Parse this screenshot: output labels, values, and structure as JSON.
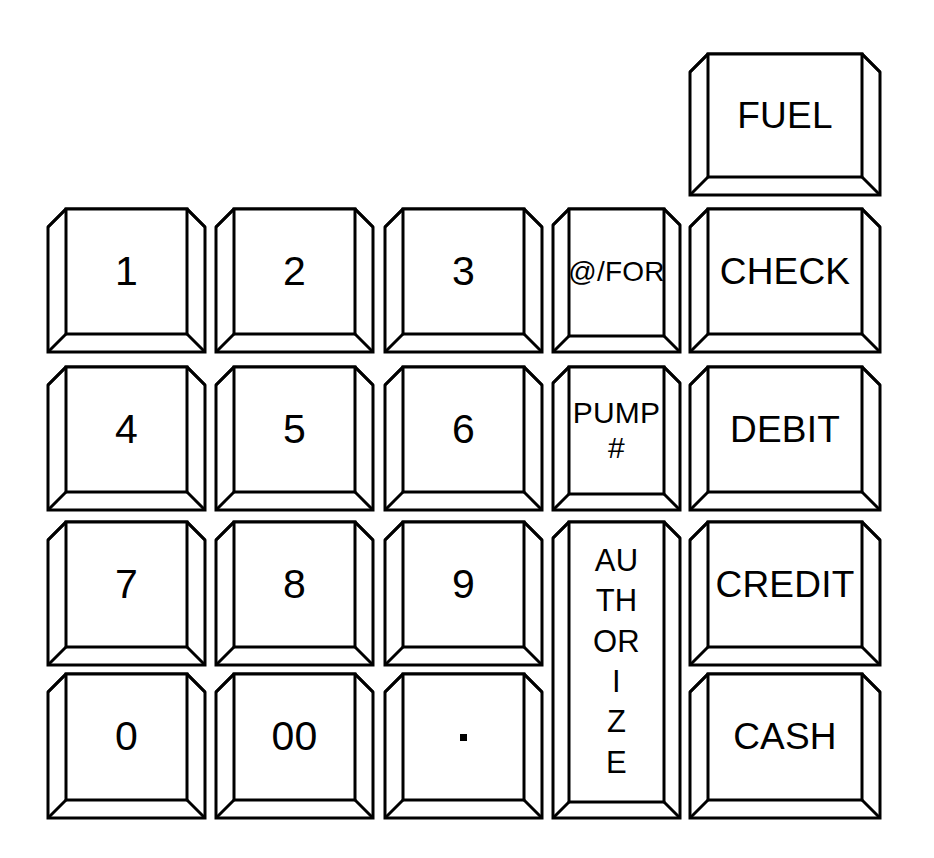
{
  "diagram": {
    "background_color": "#ffffff",
    "line_color": "#000000",
    "face_color": "#ffffff",
    "width": 934,
    "height": 858
  },
  "keys": [
    {
      "id": "fuel",
      "label": "FUEL",
      "label_style": "word",
      "x": 690,
      "y": 54,
      "w": 190,
      "h": 141,
      "bevel": 18,
      "column": 5,
      "row": 0
    },
    {
      "id": "one",
      "label": "1",
      "label_style": "digit",
      "x": 48,
      "y": 209,
      "w": 157,
      "h": 143,
      "bevel": 18,
      "column": 1,
      "row": 1
    },
    {
      "id": "two",
      "label": "2",
      "label_style": "digit",
      "x": 216,
      "y": 209,
      "w": 157,
      "h": 143,
      "bevel": 18,
      "column": 2,
      "row": 1
    },
    {
      "id": "three",
      "label": "3",
      "label_style": "digit",
      "x": 385,
      "y": 209,
      "w": 157,
      "h": 143,
      "bevel": 18,
      "column": 3,
      "row": 1
    },
    {
      "id": "at-for",
      "label": "@/FOR",
      "label_style": "small",
      "x": 553,
      "y": 209,
      "w": 127,
      "h": 143,
      "bevel": 16,
      "column": 4,
      "row": 1
    },
    {
      "id": "check",
      "label": "CHECK",
      "label_style": "word",
      "x": 690,
      "y": 209,
      "w": 190,
      "h": 143,
      "bevel": 18,
      "column": 5,
      "row": 1
    },
    {
      "id": "four",
      "label": "4",
      "label_style": "digit",
      "x": 48,
      "y": 367,
      "w": 157,
      "h": 143,
      "bevel": 18,
      "column": 1,
      "row": 2
    },
    {
      "id": "five",
      "label": "5",
      "label_style": "digit",
      "x": 216,
      "y": 367,
      "w": 157,
      "h": 143,
      "bevel": 18,
      "column": 2,
      "row": 2
    },
    {
      "id": "six",
      "label": "6",
      "label_style": "digit",
      "x": 385,
      "y": 367,
      "w": 157,
      "h": 143,
      "bevel": 18,
      "column": 3,
      "row": 2
    },
    {
      "id": "pump-number",
      "label": "PUMP\n#",
      "label_lines": [
        "PUMP",
        "#"
      ],
      "label_style": "stack",
      "x": 553,
      "y": 367,
      "w": 127,
      "h": 143,
      "bevel": 16,
      "column": 4,
      "row": 2
    },
    {
      "id": "debit",
      "label": "DEBIT",
      "label_style": "word",
      "x": 690,
      "y": 367,
      "w": 190,
      "h": 143,
      "bevel": 18,
      "column": 5,
      "row": 2
    },
    {
      "id": "seven",
      "label": "7",
      "label_style": "digit",
      "x": 48,
      "y": 522,
      "w": 157,
      "h": 143,
      "bevel": 18,
      "column": 1,
      "row": 3
    },
    {
      "id": "eight",
      "label": "8",
      "label_style": "digit",
      "x": 216,
      "y": 522,
      "w": 157,
      "h": 143,
      "bevel": 18,
      "column": 2,
      "row": 3
    },
    {
      "id": "nine",
      "label": "9",
      "label_style": "digit",
      "x": 385,
      "y": 522,
      "w": 157,
      "h": 143,
      "bevel": 18,
      "column": 3,
      "row": 3
    },
    {
      "id": "authorize",
      "label": "AUTHORIZE",
      "label_lines": [
        "AU",
        "TH",
        "OR",
        "I",
        "Z",
        "E"
      ],
      "label_style": "vstack",
      "x": 553,
      "y": 522,
      "w": 127,
      "h": 296,
      "bevel": 16,
      "column": 4,
      "row": 3,
      "row_span": 2
    },
    {
      "id": "credit",
      "label": "CREDIT",
      "label_style": "word",
      "x": 690,
      "y": 522,
      "w": 190,
      "h": 143,
      "bevel": 18,
      "column": 5,
      "row": 3
    },
    {
      "id": "zero",
      "label": "0",
      "label_style": "digit",
      "x": 48,
      "y": 674,
      "w": 157,
      "h": 144,
      "bevel": 18,
      "column": 1,
      "row": 4
    },
    {
      "id": "double-zero",
      "label": "00",
      "label_style": "digit",
      "x": 216,
      "y": 674,
      "w": 157,
      "h": 144,
      "bevel": 18,
      "column": 2,
      "row": 4
    },
    {
      "id": "decimal-point",
      "label": ".",
      "label_style": "dot",
      "x": 385,
      "y": 674,
      "w": 157,
      "h": 144,
      "bevel": 18,
      "column": 3,
      "row": 4
    },
    {
      "id": "cash",
      "label": "CASH",
      "label_style": "word",
      "x": 690,
      "y": 674,
      "w": 190,
      "h": 144,
      "bevel": 18,
      "column": 5,
      "row": 4
    }
  ]
}
